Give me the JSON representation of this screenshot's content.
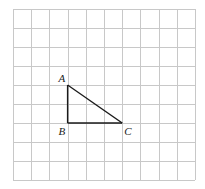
{
  "diagram": {
    "type": "grid-geometry",
    "grid": {
      "columns": 10,
      "rows": 9,
      "origin_px": [
        13,
        9
      ],
      "cell_w": 18.2,
      "cell_h": 19,
      "line_color": "#c8c8c8"
    },
    "triangle": {
      "stroke_color": "#1a1a1a",
      "vertices": [
        {
          "label": "A",
          "grid": [
            3,
            4
          ],
          "label_offset": [
            -9,
            -3
          ]
        },
        {
          "label": "B",
          "grid": [
            3,
            6
          ],
          "label_offset": [
            -9,
            12
          ]
        },
        {
          "label": "C",
          "grid": [
            6,
            6
          ],
          "label_offset": [
            2,
            12
          ]
        }
      ],
      "edges": [
        [
          "A",
          "B"
        ],
        [
          "B",
          "C"
        ],
        [
          "C",
          "A"
        ]
      ],
      "right_angle_at": "B"
    },
    "labels": {
      "A": "A",
      "B": "B",
      "C": "C"
    }
  }
}
